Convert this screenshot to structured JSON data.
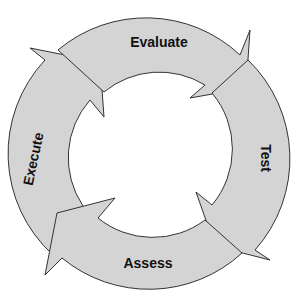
{
  "diagram": {
    "type": "cycle",
    "direction": "clockwise",
    "fill_color": "#d4d4d4",
    "stroke_color": "#333333",
    "steps": [
      {
        "label": "Evaluate",
        "position": "top"
      },
      {
        "label": "Test",
        "position": "right"
      },
      {
        "label": "Assess",
        "position": "bottom"
      },
      {
        "label": "Execute",
        "position": "left"
      }
    ]
  }
}
